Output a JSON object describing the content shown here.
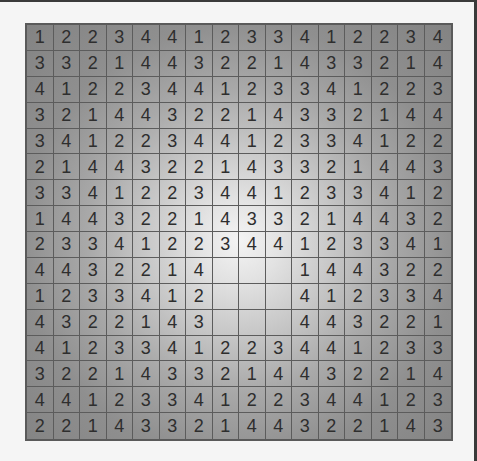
{
  "puzzle": {
    "rows": 16,
    "cols": 16,
    "grid": [
      [
        "1",
        "2",
        "2",
        "3",
        "4",
        "4",
        "1",
        "2",
        "3",
        "3",
        "4",
        "1",
        "2",
        "2",
        "3",
        "4"
      ],
      [
        "3",
        "3",
        "2",
        "1",
        "4",
        "4",
        "3",
        "2",
        "2",
        "1",
        "4",
        "3",
        "3",
        "2",
        "1",
        "4"
      ],
      [
        "4",
        "1",
        "2",
        "2",
        "3",
        "4",
        "4",
        "1",
        "2",
        "3",
        "3",
        "4",
        "1",
        "2",
        "2",
        "3"
      ],
      [
        "3",
        "2",
        "1",
        "4",
        "4",
        "3",
        "2",
        "2",
        "1",
        "4",
        "3",
        "3",
        "2",
        "1",
        "4",
        "4"
      ],
      [
        "3",
        "4",
        "1",
        "2",
        "2",
        "3",
        "4",
        "4",
        "1",
        "2",
        "3",
        "3",
        "4",
        "1",
        "2",
        "2"
      ],
      [
        "2",
        "1",
        "4",
        "4",
        "3",
        "2",
        "2",
        "1",
        "4",
        "3",
        "3",
        "2",
        "1",
        "4",
        "4",
        "3"
      ],
      [
        "3",
        "3",
        "4",
        "1",
        "2",
        "2",
        "3",
        "4",
        "4",
        "1",
        "2",
        "3",
        "3",
        "4",
        "1",
        "2"
      ],
      [
        "1",
        "4",
        "4",
        "3",
        "2",
        "2",
        "1",
        "4",
        "3",
        "3",
        "2",
        "1",
        "4",
        "4",
        "3",
        "2"
      ],
      [
        "2",
        "3",
        "3",
        "4",
        "1",
        "2",
        "2",
        "3",
        "4",
        "4",
        "1",
        "2",
        "3",
        "3",
        "4",
        "1"
      ],
      [
        "4",
        "4",
        "3",
        "2",
        "2",
        "1",
        "4",
        "",
        "",
        "",
        "1",
        "4",
        "4",
        "3",
        "2",
        "2"
      ],
      [
        "1",
        "2",
        "3",
        "3",
        "4",
        "1",
        "2",
        "",
        "",
        "",
        "4",
        "1",
        "2",
        "3",
        "3",
        "4"
      ],
      [
        "4",
        "3",
        "2",
        "2",
        "1",
        "4",
        "3",
        "",
        "",
        "",
        "4",
        "4",
        "3",
        "2",
        "2",
        "1"
      ],
      [
        "4",
        "1",
        "2",
        "3",
        "3",
        "4",
        "1",
        "2",
        "2",
        "3",
        "4",
        "4",
        "1",
        "2",
        "3",
        "3"
      ],
      [
        "3",
        "2",
        "2",
        "1",
        "4",
        "3",
        "3",
        "2",
        "1",
        "4",
        "4",
        "3",
        "2",
        "2",
        "1",
        "4"
      ],
      [
        "4",
        "4",
        "1",
        "2",
        "3",
        "3",
        "4",
        "1",
        "2",
        "2",
        "3",
        "4",
        "4",
        "1",
        "2",
        "3"
      ],
      [
        "2",
        "2",
        "1",
        "4",
        "3",
        "3",
        "2",
        "1",
        "4",
        "4",
        "3",
        "2",
        "2",
        "1",
        "4",
        "3"
      ]
    ]
  },
  "colors": {
    "grid_line": "#5c5c5c",
    "digit": "#2e2e2e",
    "center_highlight": "#f4f4f4",
    "edge_shade": "#838383",
    "frame_edge": "#3a3a3a"
  }
}
